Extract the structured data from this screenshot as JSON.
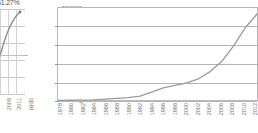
{
  "left_chart": {
    "percent_label": "51.27%",
    "x_tick_labels": [
      "2009",
      "2011"
    ],
    "axis_note": "年份",
    "gridline_count": 5
  },
  "main_chart": {
    "y_tick_labels": [
      "500000",
      "400000",
      "300000",
      "200000",
      "100000",
      "0"
    ],
    "x_tick_labels": [
      "1978",
      "1980",
      "1982",
      "1984",
      "1986",
      "1988",
      "1990",
      "1992",
      "1994",
      "1996",
      "1998",
      "2000",
      "2002",
      "2004",
      "2006",
      "2008",
      "2010",
      "2012"
    ],
    "line_color": "#9a9a9a",
    "grid_color": "#b5b5b5",
    "frame_color": "#b9b9b9"
  },
  "chart_data": {
    "type": "line",
    "title": "",
    "xlabel": "",
    "ylabel": "",
    "ylim": [
      0,
      500000
    ],
    "xlim": [
      "1978",
      "2012"
    ],
    "grid": true,
    "legend": "none",
    "categories": [
      "1978",
      "1980",
      "1982",
      "1984",
      "1986",
      "1988",
      "1990",
      "1992",
      "1994",
      "1996",
      "1998",
      "2000",
      "2002",
      "2004",
      "2006",
      "2008",
      "2010",
      "2012"
    ],
    "values": [
      3600,
      4500,
      5300,
      7000,
      10300,
      14800,
      18600,
      26700,
      48600,
      71000,
      85000,
      99200,
      121000,
      160000,
      216000,
      300000,
      398000,
      473000
    ],
    "secondary_chart": {
      "type": "line",
      "annotation": "51.27%",
      "categories": [
        "2009",
        "2011"
      ],
      "note": "partially cropped at left edge"
    }
  }
}
